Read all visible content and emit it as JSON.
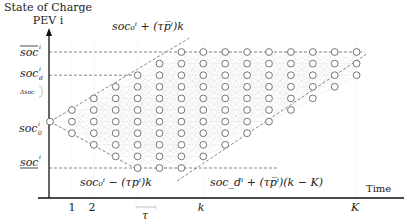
{
  "diagram": {
    "title_line1": "State of Charge",
    "title_line2": "PEV i",
    "x_axis_label": "Time",
    "y_labels": {
      "soc_max": "soc",
      "soc_max_sup": "i",
      "soc_d": "soc",
      "soc_d_sub": "d",
      "soc_d_sup": "i",
      "delta_soc": "Δsoc",
      "soc_0": "soc",
      "soc_0_sub": "0",
      "soc_0_sup": "i",
      "soc_min": "soc",
      "soc_min_sup": "i"
    },
    "x_ticks": {
      "t1": "1",
      "t2": "2",
      "tau": "τ",
      "k": "k",
      "K": "K"
    },
    "annotations": {
      "upper_bound": "soc₀ⁱ + (τp̅ⁱ)k",
      "lower_bound": "soc₀ⁱ − (τpⁱ)k",
      "final_bound": "soc_dⁱ + (τp̅ⁱ)(k − K)"
    },
    "grid": {
      "columns": 14,
      "rows": 11,
      "initial_row": 6,
      "soc_d_row": 2,
      "soc_max_row": 0,
      "soc_min_row": 10
    },
    "colors": {
      "node_stroke": "#666666",
      "edge": "#d8d8d8",
      "dashed": "#555555",
      "axis": "#111111"
    }
  }
}
